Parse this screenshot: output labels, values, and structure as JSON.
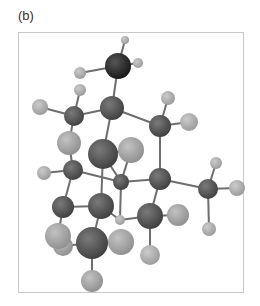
{
  "figure": {
    "panel_label": "(b)",
    "colors": {
      "heavy_dark": "#2a2a2a",
      "carbon": "#5a5a5a",
      "light_atom": "#a8a8a8",
      "hydrogen": "#b4b4b4",
      "bond": "#6e6e6e",
      "frame_border": "#c8c8c8"
    }
  },
  "atoms": [
    {
      "id": "a0",
      "type": "heavy_dark",
      "x": 118,
      "y": 66,
      "r": 13
    },
    {
      "id": "a1",
      "type": "hydrogen",
      "x": 125,
      "y": 40,
      "r": 4
    },
    {
      "id": "a2",
      "type": "hydrogen",
      "x": 138,
      "y": 63,
      "r": 5
    },
    {
      "id": "a3",
      "type": "hydrogen",
      "x": 80,
      "y": 73,
      "r": 6
    },
    {
      "id": "a4",
      "type": "hydrogen",
      "x": 80,
      "y": 90,
      "r": 6
    },
    {
      "id": "a5",
      "type": "hydrogen",
      "x": 40,
      "y": 107,
      "r": 8
    },
    {
      "id": "a6",
      "type": "carbon",
      "x": 74,
      "y": 116,
      "r": 10
    },
    {
      "id": "a7",
      "type": "carbon",
      "x": 112,
      "y": 108,
      "r": 12
    },
    {
      "id": "a8",
      "type": "hydrogen",
      "x": 168,
      "y": 98,
      "r": 7
    },
    {
      "id": "a9",
      "type": "hydrogen",
      "x": 189,
      "y": 122,
      "r": 9
    },
    {
      "id": "a10",
      "type": "carbon",
      "x": 160,
      "y": 126,
      "r": 11
    },
    {
      "id": "a11",
      "type": "light_atom",
      "x": 69,
      "y": 143,
      "r": 12
    },
    {
      "id": "a12",
      "type": "carbon",
      "x": 103,
      "y": 154,
      "r": 15
    },
    {
      "id": "a13",
      "type": "light_atom",
      "x": 131,
      "y": 150,
      "r": 13
    },
    {
      "id": "a14",
      "type": "hydrogen",
      "x": 44,
      "y": 173,
      "r": 7
    },
    {
      "id": "a15",
      "type": "carbon",
      "x": 73,
      "y": 170,
      "r": 10
    },
    {
      "id": "a16",
      "type": "carbon",
      "x": 121,
      "y": 182,
      "r": 8
    },
    {
      "id": "a17",
      "type": "carbon",
      "x": 160,
      "y": 179,
      "r": 11
    },
    {
      "id": "a18",
      "type": "hydrogen",
      "x": 216,
      "y": 163,
      "r": 6
    },
    {
      "id": "a19",
      "type": "carbon",
      "x": 208,
      "y": 189,
      "r": 10
    },
    {
      "id": "a20",
      "type": "hydrogen",
      "x": 237,
      "y": 188,
      "r": 8
    },
    {
      "id": "a21",
      "type": "hydrogen",
      "x": 209,
      "y": 229,
      "r": 7
    },
    {
      "id": "a22",
      "type": "carbon",
      "x": 63,
      "y": 207,
      "r": 11
    },
    {
      "id": "a23",
      "type": "carbon",
      "x": 101,
      "y": 206,
      "r": 13
    },
    {
      "id": "a24",
      "type": "hydrogen",
      "x": 120,
      "y": 220,
      "r": 5
    },
    {
      "id": "a25",
      "type": "carbon",
      "x": 150,
      "y": 216,
      "r": 13
    },
    {
      "id": "a26",
      "type": "light_atom",
      "x": 178,
      "y": 215,
      "r": 11
    },
    {
      "id": "a27",
      "type": "light_atom",
      "x": 63,
      "y": 246,
      "r": 10
    },
    {
      "id": "a28",
      "type": "light_atom",
      "x": 58,
      "y": 236,
      "r": 13
    },
    {
      "id": "a29",
      "type": "hydrogen",
      "x": 150,
      "y": 255,
      "r": 10
    },
    {
      "id": "a30",
      "type": "light_atom",
      "x": 121,
      "y": 242,
      "r": 13
    },
    {
      "id": "a31",
      "type": "carbon",
      "x": 92,
      "y": 243,
      "r": 16
    },
    {
      "id": "a32",
      "type": "light_atom",
      "x": 92,
      "y": 281,
      "r": 11
    }
  ],
  "bonds": [
    [
      "a0",
      "a1"
    ],
    [
      "a0",
      "a2"
    ],
    [
      "a0",
      "a3"
    ],
    [
      "a0",
      "a7"
    ],
    [
      "a6",
      "a4"
    ],
    [
      "a6",
      "a5"
    ],
    [
      "a6",
      "a7"
    ],
    [
      "a6",
      "a11"
    ],
    [
      "a7",
      "a10"
    ],
    [
      "a7",
      "a12"
    ],
    [
      "a10",
      "a8"
    ],
    [
      "a10",
      "a9"
    ],
    [
      "a10",
      "a17"
    ],
    [
      "a11",
      "a15"
    ],
    [
      "a12",
      "a13"
    ],
    [
      "a12",
      "a23"
    ],
    [
      "a12",
      "a16"
    ],
    [
      "a13",
      "a16"
    ],
    [
      "a15",
      "a14"
    ],
    [
      "a15",
      "a16"
    ],
    [
      "a15",
      "a22"
    ],
    [
      "a16",
      "a17"
    ],
    [
      "a16",
      "a24"
    ],
    [
      "a17",
      "a19"
    ],
    [
      "a17",
      "a25"
    ],
    [
      "a19",
      "a18"
    ],
    [
      "a19",
      "a20"
    ],
    [
      "a19",
      "a21"
    ],
    [
      "a22",
      "a23"
    ],
    [
      "a22",
      "a28"
    ],
    [
      "a23",
      "a31"
    ],
    [
      "a23",
      "a24"
    ],
    [
      "a25",
      "a26"
    ],
    [
      "a25",
      "a29"
    ],
    [
      "a25",
      "a24"
    ],
    [
      "a31",
      "a27"
    ],
    [
      "a31",
      "a30"
    ],
    [
      "a31",
      "a32"
    ]
  ]
}
